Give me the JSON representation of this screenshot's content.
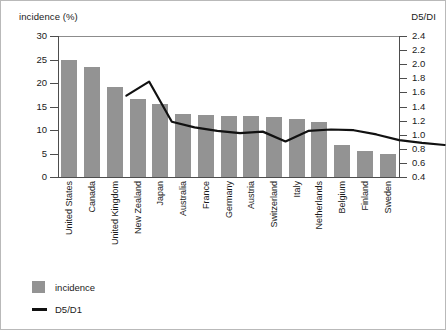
{
  "chart_data": {
    "type": "bar",
    "title": "",
    "categories": [
      "United States",
      "Canada",
      "United Kingdom",
      "New Zealand",
      "Japan",
      "Australia",
      "France",
      "Germany",
      "Austria",
      "Switzerland",
      "Italy",
      "Netherlands",
      "Belgium",
      "Finland",
      "Sweden"
    ],
    "series": [
      {
        "name": "incidence",
        "type": "bar",
        "axis": "left",
        "color": "#939393",
        "values": [
          24.8,
          23.4,
          19.2,
          16.7,
          15.5,
          13.5,
          13.1,
          13.0,
          12.9,
          12.7,
          12.3,
          11.6,
          6.9,
          5.5,
          4.8
        ]
      },
      {
        "name": "D5/D1",
        "type": "line",
        "axis": "right",
        "color": "#111111",
        "values": [
          2.05,
          2.25,
          1.68,
          1.6,
          1.55,
          1.52,
          1.54,
          1.4,
          1.55,
          1.57,
          1.56,
          1.5,
          1.42,
          1.38,
          1.35
        ]
      }
    ],
    "left_axis": {
      "label": "incidence (%)",
      "ticks": [
        "0",
        "5",
        "10",
        "15",
        "20",
        "25",
        "30"
      ],
      "min": 0,
      "max": 30,
      "step": 5
    },
    "right_axis": {
      "label": "D5/DI",
      "ticks": [
        "0.4",
        "0.6",
        "0.8",
        "1.0",
        "1.2",
        "1.4",
        "1.6",
        "1.8",
        "2.0",
        "2.2",
        "2.4"
      ],
      "min": 0.4,
      "max": 2.4,
      "step": 0.2
    },
    "xlabel": "",
    "grid": false,
    "legend_position": "bottom-left",
    "legend": [
      {
        "label": "incidence",
        "marker": "square",
        "color": "#939393"
      },
      {
        "label": "D5/D1",
        "marker": "line",
        "color": "#111111"
      }
    ]
  }
}
